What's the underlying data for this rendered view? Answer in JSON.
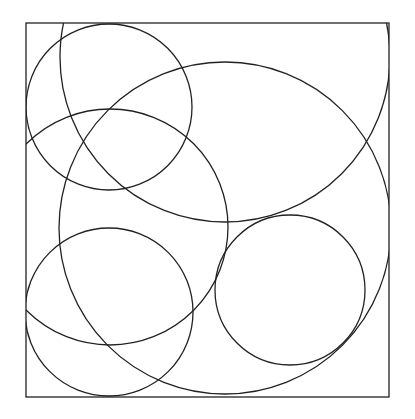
{
  "diagram": {
    "stroke_color": "#222222",
    "background": "#ffffff",
    "frame": {
      "x": 26,
      "y": 23,
      "width": 363,
      "height": 374
    },
    "circles": [
      {
        "name": "top-left-circle",
        "cx": 109,
        "cy": 107,
        "r": 83
      },
      {
        "name": "top-large-circle",
        "cx": 225,
        "cy": 57,
        "r": 165
      },
      {
        "name": "large-main-circle",
        "cx": 225,
        "cy": 228,
        "r": 166
      },
      {
        "name": "middle-left-circle",
        "cx": 110,
        "cy": 227,
        "r": 118
      },
      {
        "name": "bottom-left-circle",
        "cx": 109,
        "cy": 312,
        "r": 84
      },
      {
        "name": "bottom-right-circle",
        "cx": 290,
        "cy": 290,
        "r": 75
      }
    ]
  }
}
